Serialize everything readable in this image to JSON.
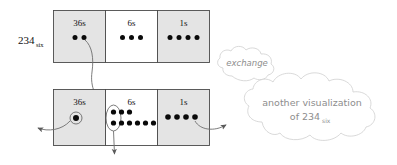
{
  "diagram": {
    "left_label": {
      "number": "234",
      "subscript": "six"
    },
    "colors": {
      "shaded_cell": "#e4e4e4",
      "plain_cell": "#ffffff",
      "cell_border": "#4a4a4a",
      "dot": "#0a0a0a",
      "connector": "#6e6e6e",
      "cloud_stroke": "#cfcfcf",
      "cloud_text": "#8d8d8d"
    },
    "tables": [
      {
        "name": "top-table",
        "cells": [
          {
            "place": "36s",
            "shaded": true,
            "dot_rows": [
              2
            ]
          },
          {
            "place": "6s",
            "shaded": false,
            "dot_rows": [
              3
            ]
          },
          {
            "place": "1s",
            "shaded": true,
            "dot_rows": [
              4
            ]
          }
        ]
      },
      {
        "name": "bottom-table",
        "cells": [
          {
            "place": "36s",
            "shaded": true,
            "dot_rows": [
              1
            ],
            "circled": true
          },
          {
            "place": "6s",
            "shaded": false,
            "dot_rows": [
              3,
              6
            ],
            "circled_column": true
          },
          {
            "place": "1s",
            "shaded": true,
            "dot_rows": [
              4
            ]
          }
        ]
      }
    ],
    "clouds": [
      {
        "name": "exchange-cloud",
        "lines": [
          "exchange"
        ]
      },
      {
        "name": "another-visualization-cloud",
        "lines": [
          "another visualization",
          "of 234"
        ],
        "subscript": "six"
      }
    ],
    "connectors": [
      {
        "name": "exchange-arrow-top-36s-to-bottom-6s",
        "from": "top 36s dots",
        "to": "bottom 6s group"
      },
      {
        "name": "arrow-bottom-36s-left",
        "from": "bottom 36s circled dot",
        "to": "left margin"
      },
      {
        "name": "arrow-bottom-6s-down",
        "from": "bottom 6s oval",
        "to": "below table"
      },
      {
        "name": "arrow-bottom-1s-right",
        "from": "bottom 1s dots",
        "to": "another-visualization cloud"
      }
    ]
  }
}
